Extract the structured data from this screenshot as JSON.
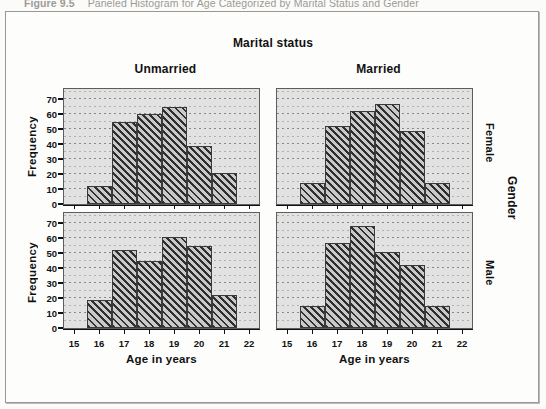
{
  "caption": {
    "number": "Figure 9.5",
    "title": "Paneled Histogram for Age Categorized by Marital Status and Gender"
  },
  "titles": {
    "column_group": "Marital status",
    "row_group": "Gender"
  },
  "columns": [
    {
      "label": "Unmarried"
    },
    {
      "label": "Married"
    }
  ],
  "rows": [
    {
      "label": "Female"
    },
    {
      "label": "Male"
    }
  ],
  "axes": {
    "y_label": "Frequency",
    "x_label": "Age in years",
    "y_ticks": [
      0,
      10,
      20,
      30,
      40,
      50,
      60,
      70
    ],
    "x_ticks": [
      15,
      16,
      17,
      18,
      19,
      20,
      21,
      22
    ],
    "y_min": 0,
    "y_max": 77,
    "x_min": 14.6,
    "x_max": 22.4
  },
  "chart_data": {
    "type": "bar",
    "title": "Paneled Histogram for Age Categorized by Marital Status and Gender",
    "xlabel": "Age in years",
    "ylabel": "Frequency",
    "xlim": [
      14.6,
      22.4
    ],
    "ylim": [
      0,
      77
    ],
    "grid": true,
    "legend": "none",
    "categories": [
      16,
      17,
      18,
      19,
      20,
      21
    ],
    "bin_edges": [
      15.5,
      16.5,
      17.5,
      18.5,
      19.5,
      20.5,
      21.5
    ],
    "panels": [
      {
        "marital_status": "Unmarried",
        "gender": "Female",
        "values": [
          12,
          55,
          60,
          65,
          39,
          21
        ]
      },
      {
        "marital_status": "Married",
        "gender": "Female",
        "values": [
          14,
          52,
          62,
          67,
          49,
          14
        ]
      },
      {
        "marital_status": "Unmarried",
        "gender": "Male",
        "values": [
          19,
          52,
          45,
          61,
          55,
          22
        ]
      },
      {
        "marital_status": "Married",
        "gender": "Male",
        "values": [
          15,
          57,
          68,
          51,
          42,
          15
        ]
      }
    ]
  }
}
